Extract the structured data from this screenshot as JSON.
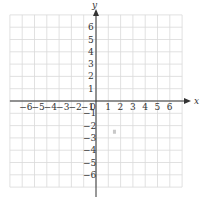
{
  "diagram": {
    "type": "coordinate-plane",
    "x_axis": {
      "label": "x",
      "min": -7,
      "max": 7,
      "tick_labels": [
        "−6",
        "−5",
        "−4",
        "−3",
        "−2",
        "−1",
        "1",
        "2",
        "3",
        "4",
        "5",
        "6"
      ]
    },
    "y_axis": {
      "label": "y",
      "min": -7,
      "max": 7,
      "tick_labels": [
        "6",
        "5",
        "4",
        "3",
        "2",
        "1",
        "−1",
        "−2",
        "−3",
        "−4",
        "−5",
        "−6"
      ]
    },
    "origin_label": "0",
    "grid": {
      "step": 1,
      "color": "#d9d9d9"
    },
    "axis_color": "#333333",
    "marks": [
      {
        "x": 1.5,
        "y": -2.5,
        "color": "#c8c8c8"
      }
    ]
  }
}
